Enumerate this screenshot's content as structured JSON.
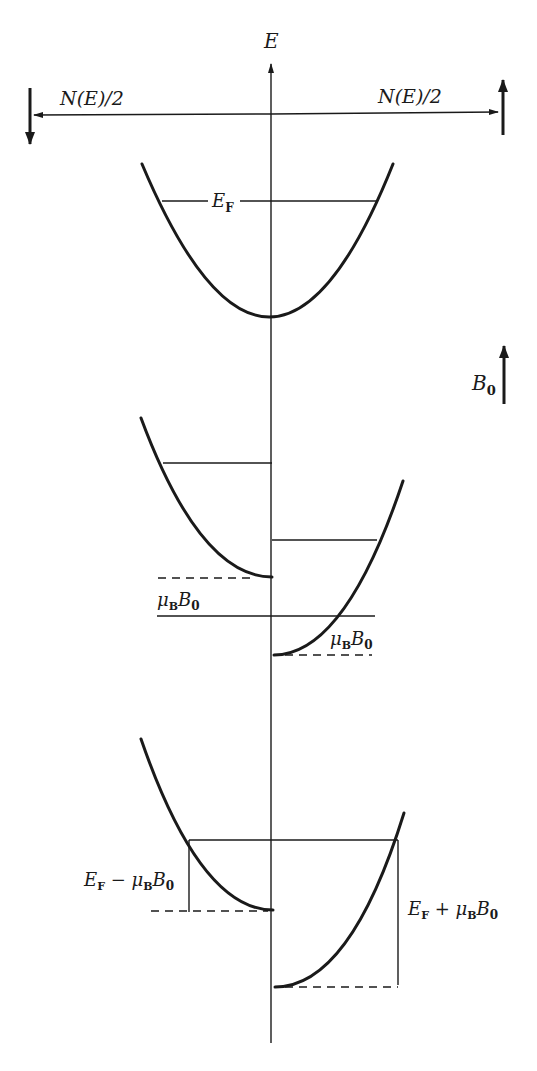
{
  "diagram": {
    "type": "density-of-states spin-split bands (Pauli paramagnetism)",
    "axes": {
      "vertical_label": "E",
      "horizontal_left_label": "N(E)/2",
      "horizontal_right_label": "N(E)/2",
      "left_spin": "down",
      "right_spin": "up"
    },
    "field": {
      "label_main": "B",
      "label_sub": "0",
      "direction": "up"
    },
    "panels": [
      {
        "name": "zero-field",
        "labels": [
          {
            "main": "E",
            "sub": "F"
          }
        ]
      },
      {
        "name": "field-applied-nonequilibrium",
        "labels": [
          {
            "main1": "μ",
            "sub1": "B",
            "main2": "B",
            "sub2": "0",
            "position": "left"
          },
          {
            "main1": "μ",
            "sub1": "B",
            "main2": "B",
            "sub2": "0",
            "position": "right"
          }
        ]
      },
      {
        "name": "field-applied-equilibrium",
        "labels": [
          {
            "text_pre": "E",
            "sub_pre": "F",
            "op": " − ",
            "main1": "μ",
            "sub1": "B",
            "main2": "B",
            "sub2": "0",
            "position": "left"
          },
          {
            "text_pre": "E",
            "sub_pre": "F",
            "op": " + ",
            "main1": "μ",
            "sub1": "B",
            "main2": "B",
            "sub2": "0",
            "position": "right"
          }
        ]
      }
    ],
    "colors": {
      "ink": "#1a1a1a",
      "background": "#ffffff"
    }
  }
}
